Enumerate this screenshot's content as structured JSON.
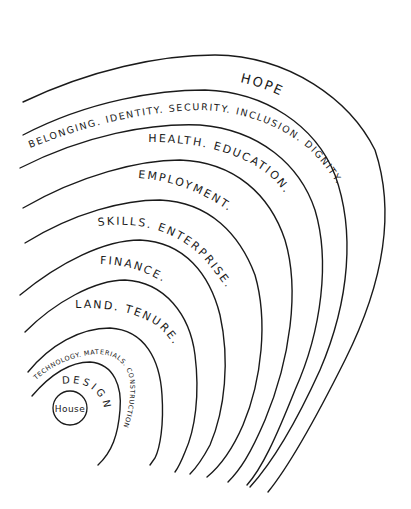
{
  "diagram": {
    "type": "concentric-arcs",
    "stroke_color": "#1a1a1a",
    "background": "#ffffff",
    "core": {
      "label": "House"
    },
    "layers": [
      {
        "label": "DESIGN"
      },
      {
        "label": "TECHNOLOGY. MATERIALS. CONSTRUCTION"
      },
      {
        "label": "LAND. TENURE."
      },
      {
        "label": "FINANCE."
      },
      {
        "label": "SKILLS. ENTERPRISE."
      },
      {
        "label": "EMPLOYMENT."
      },
      {
        "label": "HEALTH. EDUCATION."
      },
      {
        "label": "BELONGING. IDENTITY. SECURITY. INCLUSION. DIGNITY."
      },
      {
        "label": "HOPE"
      }
    ]
  }
}
